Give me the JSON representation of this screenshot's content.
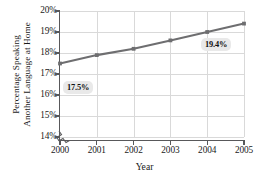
{
  "chart_data": {
    "type": "line",
    "title": "",
    "xlabel": "Year",
    "ylabel": "Percentage Speaking Another Language at Home",
    "ylabel_line1": "Percentage Speaking",
    "ylabel_line2": "Another Language at Home",
    "x": [
      2000,
      2001,
      2002,
      2003,
      2004,
      2005
    ],
    "categories": [
      "2000",
      "2001",
      "2002",
      "2003",
      "2004",
      "2005"
    ],
    "values": [
      17.5,
      17.9,
      18.2,
      18.6,
      19.0,
      19.4
    ],
    "series": [
      {
        "name": "Percentage Speaking Another Language at Home",
        "values": [
          17.5,
          17.9,
          18.2,
          18.6,
          19.0,
          19.4
        ],
        "color": "#6e6e70"
      }
    ],
    "xlim": [
      2000,
      2005
    ],
    "ylim": [
      14,
      20
    ],
    "ytick_labels": [
      "20%",
      "19%",
      "18%",
      "17%",
      "16%",
      "15%",
      "14%"
    ],
    "ytick_values": [
      20,
      19,
      18,
      17,
      16,
      15,
      14
    ],
    "xtick_labels": [
      "2000",
      "2001",
      "2002",
      "2003",
      "2004",
      "2005"
    ],
    "grid": true,
    "legend": "none",
    "axis_break": true,
    "annotations": [
      {
        "text": "17.5%",
        "x": 2000,
        "y": 17.5,
        "placement": "below-right"
      },
      {
        "text": "19.4%",
        "x": 2005,
        "y": 19.4,
        "placement": "below-left"
      }
    ],
    "colors": {
      "line": "#6e6e70",
      "marker": "#6e6e70",
      "grid": "#d9d9d9",
      "axis": "#58585a",
      "callout_bg": "#e9e9e9",
      "text": "#1a1a1a"
    }
  }
}
